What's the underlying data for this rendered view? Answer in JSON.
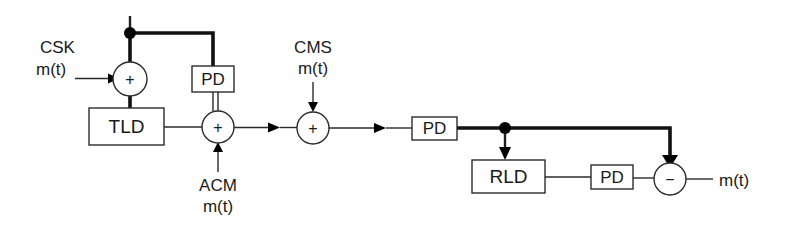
{
  "diagram": {
    "colors": {
      "wire": "#2b2b2b",
      "wire_thick": "#111111",
      "text": "#1a1a1a",
      "background": "#ffffff",
      "node_dot": "#000000"
    },
    "blocks": [
      {
        "id": "tld",
        "label": "TLD",
        "x": 89,
        "y": 108,
        "w": 75,
        "h": 37
      },
      {
        "id": "pd1",
        "label": "PD",
        "x": 192,
        "y": 66,
        "w": 42,
        "h": 26
      },
      {
        "id": "pd2",
        "label": "PD",
        "x": 412,
        "y": 117,
        "w": 45,
        "h": 23
      },
      {
        "id": "rld",
        "label": "RLD",
        "x": 472,
        "y": 160,
        "w": 73,
        "h": 33
      },
      {
        "id": "pd3",
        "label": "PD",
        "x": 591,
        "y": 165,
        "w": 42,
        "h": 24
      }
    ],
    "junctions": [
      {
        "id": "sum1",
        "sign": "+",
        "cx": 130,
        "cy": 79,
        "r": 17
      },
      {
        "id": "sum2",
        "sign": "+",
        "cx": 218,
        "cy": 127,
        "r": 16
      },
      {
        "id": "sum3",
        "sign": "+",
        "cx": 313,
        "cy": 128,
        "r": 16
      },
      {
        "id": "sub1",
        "sign": "−",
        "cx": 670,
        "cy": 179,
        "r": 16
      }
    ],
    "nodes": [
      {
        "id": "tap-top",
        "cx": 130,
        "cy": 33,
        "r": 5.5
      },
      {
        "id": "tap-right",
        "cx": 505,
        "cy": 128,
        "r": 5.5
      }
    ],
    "labels": [
      {
        "id": "csk",
        "line1": "CSK",
        "line2": "m(t)"
      },
      {
        "id": "acm",
        "line1": "ACM",
        "line2": "m(t)"
      },
      {
        "id": "cms",
        "line1": "CMS",
        "line2": "m(t)"
      },
      {
        "id": "output-mt",
        "line1": "m(t)",
        "line2": ""
      }
    ],
    "text": {
      "csk_top": "CSK",
      "csk_bottom": "m(t)",
      "acm_top": "ACM",
      "acm_bottom": "m(t)",
      "cms_top": "CMS",
      "cms_bottom": "m(t)",
      "output": "m(t)",
      "tld": "TLD",
      "pd1": "PD",
      "pd2": "PD",
      "rld": "RLD",
      "pd3": "PD",
      "plus1": "+",
      "plus2": "+",
      "plus3": "+",
      "minus": "−"
    }
  }
}
